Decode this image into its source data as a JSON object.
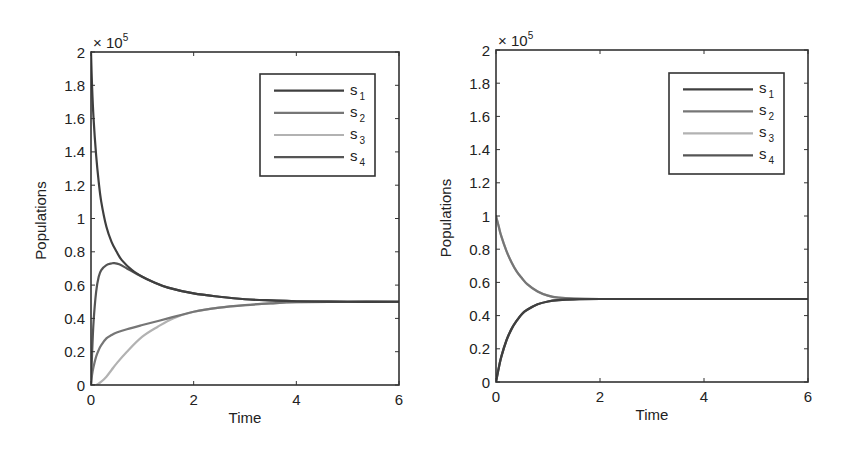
{
  "chart_data": [
    {
      "type": "line",
      "title": "",
      "xlabel": "Time",
      "ylabel": "Populations",
      "y_multiplier_label": "× 10",
      "y_multiplier_exp": "5",
      "xlim": [
        0,
        6
      ],
      "ylim": [
        0,
        2
      ],
      "xticks": [
        0,
        2,
        4,
        6
      ],
      "xtick_labels": [
        "0",
        "2",
        "4",
        "6"
      ],
      "yticks": [
        0,
        0.2,
        0.4,
        0.6,
        0.8,
        1,
        1.2,
        1.4,
        1.6,
        1.8,
        2
      ],
      "ytick_labels": [
        "0",
        "0.2",
        "0.4",
        "0.6",
        "0.8",
        "1",
        "1.2",
        "1.4",
        "1.6",
        "1.8",
        "2"
      ],
      "grid": false,
      "legend_position": "upper right",
      "frame": {
        "x0": 91,
        "y0": 52,
        "x1": 399,
        "y1": 385
      },
      "legend_box": {
        "x0": 260,
        "y0": 74,
        "x1": 375,
        "y1": 176
      },
      "series": [
        {
          "name": "s",
          "sub": "1",
          "color": "#3f3f3f",
          "x": [
            0,
            0.02,
            0.05,
            0.1,
            0.15,
            0.2,
            0.3,
            0.4,
            0.5,
            0.6,
            0.8,
            1.0,
            1.2,
            1.5,
            2.0,
            2.5,
            3.0,
            3.5,
            4.0,
            5.0,
            6.0
          ],
          "values": [
            2.0,
            1.8,
            1.6,
            1.38,
            1.22,
            1.1,
            0.95,
            0.86,
            0.8,
            0.75,
            0.69,
            0.65,
            0.62,
            0.585,
            0.55,
            0.53,
            0.515,
            0.508,
            0.503,
            0.5,
            0.5
          ]
        },
        {
          "name": "s",
          "sub": "2",
          "color": "#767676",
          "x": [
            0,
            0.02,
            0.05,
            0.1,
            0.15,
            0.2,
            0.3,
            0.4,
            0.5,
            0.7,
            1.0,
            1.5,
            2.0,
            2.5,
            3.0,
            3.5,
            4.0,
            5.0,
            6.0
          ],
          "values": [
            0.0,
            0.06,
            0.11,
            0.17,
            0.21,
            0.24,
            0.28,
            0.3,
            0.315,
            0.335,
            0.36,
            0.4,
            0.44,
            0.465,
            0.48,
            0.49,
            0.497,
            0.5,
            0.5
          ]
        },
        {
          "name": "s",
          "sub": "3",
          "color": "#b2b2b2",
          "x": [
            0,
            0.1,
            0.2,
            0.3,
            0.4,
            0.5,
            0.7,
            1.0,
            1.3,
            1.6,
            2.0,
            2.5,
            3.0,
            3.5,
            4.0,
            5.0,
            6.0
          ],
          "values": [
            0.0,
            0.0,
            0.02,
            0.05,
            0.09,
            0.13,
            0.2,
            0.29,
            0.35,
            0.4,
            0.44,
            0.465,
            0.48,
            0.49,
            0.497,
            0.5,
            0.5
          ]
        },
        {
          "name": "s",
          "sub": "4",
          "color": "#555555",
          "x": [
            0,
            0.02,
            0.05,
            0.1,
            0.15,
            0.2,
            0.3,
            0.4,
            0.45,
            0.55,
            0.7,
            0.9,
            1.2,
            1.5,
            2.0,
            2.5,
            3.0,
            3.5,
            4.0,
            5.0,
            6.0
          ],
          "values": [
            0.0,
            0.18,
            0.38,
            0.56,
            0.65,
            0.69,
            0.72,
            0.73,
            0.732,
            0.725,
            0.7,
            0.665,
            0.62,
            0.585,
            0.55,
            0.53,
            0.515,
            0.508,
            0.503,
            0.5,
            0.5
          ]
        }
      ]
    },
    {
      "type": "line",
      "title": "",
      "xlabel": "Time",
      "ylabel": "Populations",
      "y_multiplier_label": "× 10",
      "y_multiplier_exp": "5",
      "xlim": [
        0,
        6
      ],
      "ylim": [
        0,
        2
      ],
      "xticks": [
        0,
        2,
        4,
        6
      ],
      "xtick_labels": [
        "0",
        "2",
        "4",
        "6"
      ],
      "yticks": [
        0,
        0.2,
        0.4,
        0.6,
        0.8,
        1,
        1.2,
        1.4,
        1.6,
        1.8,
        2
      ],
      "ytick_labels": [
        "0",
        "0.2",
        "0.4",
        "0.6",
        "0.8",
        "1",
        "1.2",
        "1.4",
        "1.6",
        "1.8",
        "2"
      ],
      "grid": false,
      "legend_position": "upper right",
      "frame": {
        "x0": 496,
        "y0": 50,
        "x1": 808,
        "y1": 382
      },
      "legend_box": {
        "x0": 669,
        "y0": 73,
        "x1": 784,
        "y1": 174
      },
      "series": [
        {
          "name": "s",
          "sub": "1",
          "color": "#3f3f3f",
          "x": [
            0,
            0.05,
            0.1,
            0.2,
            0.3,
            0.4,
            0.5,
            0.6,
            0.8,
            1.0,
            1.2,
            1.5,
            2.0,
            3.0,
            4.0,
            5.0,
            6.0
          ],
          "values": [
            0.0,
            0.08,
            0.15,
            0.25,
            0.32,
            0.37,
            0.41,
            0.435,
            0.468,
            0.485,
            0.493,
            0.498,
            0.5,
            0.5,
            0.5,
            0.5,
            0.5
          ]
        },
        {
          "name": "s",
          "sub": "2",
          "color": "#767676",
          "x": [
            0,
            0.05,
            0.1,
            0.2,
            0.3,
            0.4,
            0.5,
            0.6,
            0.8,
            1.0,
            1.2,
            1.5,
            2.0,
            3.0,
            4.0,
            5.0,
            6.0
          ],
          "values": [
            1.0,
            0.94,
            0.88,
            0.79,
            0.72,
            0.665,
            0.625,
            0.59,
            0.545,
            0.52,
            0.508,
            0.502,
            0.5,
            0.5,
            0.5,
            0.5,
            0.5
          ]
        },
        {
          "name": "s",
          "sub": "3",
          "color": "#b2b2b2",
          "x": [
            0,
            0.05,
            0.1,
            0.2,
            0.3,
            0.4,
            0.5,
            0.6,
            0.8,
            1.0,
            1.2,
            1.5,
            2.0,
            3.0,
            4.0,
            5.0,
            6.0
          ],
          "values": [
            1.0,
            0.94,
            0.88,
            0.79,
            0.72,
            0.665,
            0.625,
            0.59,
            0.545,
            0.52,
            0.508,
            0.502,
            0.5,
            0.5,
            0.5,
            0.5,
            0.5
          ]
        },
        {
          "name": "s",
          "sub": "4",
          "color": "#555555",
          "x": [
            0,
            0.05,
            0.1,
            0.2,
            0.3,
            0.4,
            0.5,
            0.6,
            0.8,
            1.0,
            1.2,
            1.5,
            2.0,
            3.0,
            4.0,
            5.0,
            6.0
          ],
          "values": [
            0.0,
            0.08,
            0.15,
            0.25,
            0.32,
            0.37,
            0.41,
            0.435,
            0.468,
            0.485,
            0.493,
            0.498,
            0.5,
            0.5,
            0.5,
            0.5,
            0.5
          ]
        }
      ]
    }
  ]
}
